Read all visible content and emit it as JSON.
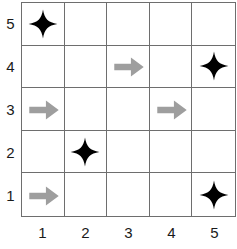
{
  "puzzle": {
    "title": "5x5 grid puzzle with stars and right arrows",
    "grid_size": 5,
    "colors": {
      "grid_line": "#6e6e6e",
      "star": "#000000",
      "arrow": "#9e9e9e",
      "label": "#1a1a1a",
      "background": "#ffffff"
    },
    "x_axis": {
      "labels": [
        "1",
        "2",
        "3",
        "4",
        "5"
      ]
    },
    "y_axis": {
      "labels": [
        "5",
        "4",
        "3",
        "2",
        "1"
      ]
    },
    "icons": {
      "star": "four-pointed-star-icon",
      "arrow": "right-arrow-icon",
      "empty": "empty-cell"
    },
    "rows": [
      {
        "row_label": "5",
        "cells": [
          {
            "x": "1",
            "y": "5",
            "icon": "star"
          },
          {
            "x": "2",
            "y": "5",
            "icon": "empty"
          },
          {
            "x": "3",
            "y": "5",
            "icon": "empty"
          },
          {
            "x": "4",
            "y": "5",
            "icon": "empty"
          },
          {
            "x": "5",
            "y": "5",
            "icon": "empty"
          }
        ]
      },
      {
        "row_label": "4",
        "cells": [
          {
            "x": "1",
            "y": "4",
            "icon": "empty"
          },
          {
            "x": "2",
            "y": "4",
            "icon": "empty"
          },
          {
            "x": "3",
            "y": "4",
            "icon": "arrow"
          },
          {
            "x": "4",
            "y": "4",
            "icon": "empty"
          },
          {
            "x": "5",
            "y": "4",
            "icon": "star"
          }
        ]
      },
      {
        "row_label": "3",
        "cells": [
          {
            "x": "1",
            "y": "3",
            "icon": "arrow"
          },
          {
            "x": "2",
            "y": "3",
            "icon": "empty"
          },
          {
            "x": "3",
            "y": "3",
            "icon": "empty"
          },
          {
            "x": "4",
            "y": "3",
            "icon": "arrow"
          },
          {
            "x": "5",
            "y": "3",
            "icon": "empty"
          }
        ]
      },
      {
        "row_label": "2",
        "cells": [
          {
            "x": "1",
            "y": "2",
            "icon": "empty"
          },
          {
            "x": "2",
            "y": "2",
            "icon": "star"
          },
          {
            "x": "3",
            "y": "2",
            "icon": "empty"
          },
          {
            "x": "4",
            "y": "2",
            "icon": "empty"
          },
          {
            "x": "5",
            "y": "2",
            "icon": "empty"
          }
        ]
      },
      {
        "row_label": "1",
        "cells": [
          {
            "x": "1",
            "y": "1",
            "icon": "arrow"
          },
          {
            "x": "2",
            "y": "1",
            "icon": "empty"
          },
          {
            "x": "3",
            "y": "1",
            "icon": "empty"
          },
          {
            "x": "4",
            "y": "1",
            "icon": "empty"
          },
          {
            "x": "5",
            "y": "1",
            "icon": "star"
          }
        ]
      }
    ]
  }
}
